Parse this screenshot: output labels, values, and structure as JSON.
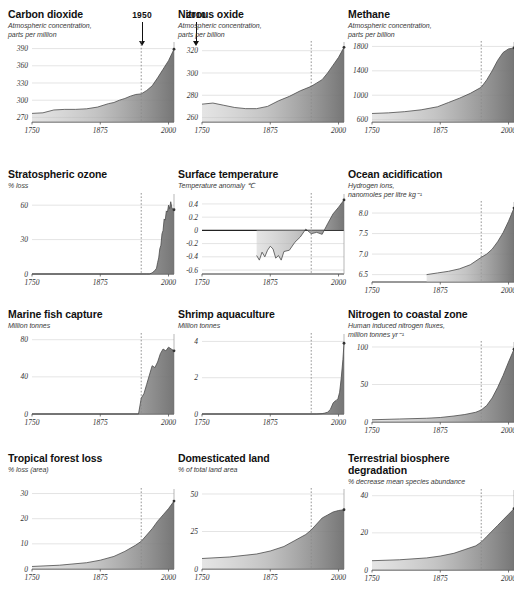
{
  "figure": {
    "annotations": [
      {
        "label": "1950",
        "x": 142
      },
      {
        "label": "2010",
        "x": 196
      }
    ]
  },
  "chart_data": [
    {
      "id": "carbon-dioxide",
      "type": "area",
      "title": "Carbon dioxide",
      "subtitle": "Atmospheric concentration,\nparts per million",
      "ylabel": "Atmospheric concentration, parts per million",
      "xlabel": "",
      "yticks": [
        270,
        300,
        330,
        360,
        390
      ],
      "ylim": [
        262,
        398
      ],
      "xticks": [
        1750,
        1875,
        2000
      ],
      "xlim": [
        1750,
        2010
      ],
      "marker_year": 1950,
      "grid": true,
      "x": [
        1750,
        1770,
        1790,
        1810,
        1830,
        1850,
        1870,
        1890,
        1900,
        1910,
        1920,
        1930,
        1940,
        1950,
        1960,
        1970,
        1980,
        1990,
        2000,
        2010
      ],
      "values": [
        277,
        278,
        283,
        284,
        284,
        285,
        288,
        294,
        296,
        300,
        303,
        307,
        310,
        311,
        317,
        325,
        339,
        354,
        369,
        389
      ]
    },
    {
      "id": "nitrous-oxide",
      "type": "area",
      "title": "Nitrous oxide",
      "subtitle": "Atmospheric concentration,\nparts per billion",
      "ylabel": "Atmospheric concentration, parts per billion",
      "xlabel": "",
      "yticks": [
        260,
        280,
        300,
        320
      ],
      "ylim": [
        256,
        326
      ],
      "xticks": [
        1750,
        1875,
        2000
      ],
      "xlim": [
        1750,
        2010
      ],
      "marker_year": 1950,
      "grid": true,
      "x": [
        1750,
        1770,
        1790,
        1810,
        1830,
        1850,
        1870,
        1890,
        1910,
        1930,
        1950,
        1960,
        1970,
        1980,
        1990,
        2000,
        2010
      ],
      "values": [
        272,
        273,
        271,
        269,
        268,
        268,
        270,
        275,
        279,
        284,
        288,
        291,
        294,
        300,
        307,
        314,
        323
      ]
    },
    {
      "id": "methane",
      "type": "area",
      "title": "Methane",
      "subtitle": "Atmospheric concentration,\nparts per billion",
      "ylabel": "Atmospheric concentration, parts per billion",
      "xlabel": "",
      "yticks": [
        600,
        1000,
        1400,
        1800
      ],
      "ylim": [
        560,
        1840
      ],
      "xticks": [
        1750,
        1875,
        2000
      ],
      "xlim": [
        1750,
        2010
      ],
      "marker_year": 1950,
      "grid": true,
      "x": [
        1750,
        1780,
        1810,
        1840,
        1870,
        1890,
        1910,
        1930,
        1950,
        1960,
        1970,
        1980,
        1990,
        2000,
        2010
      ],
      "values": [
        700,
        710,
        730,
        760,
        810,
        880,
        950,
        1030,
        1130,
        1250,
        1400,
        1570,
        1700,
        1760,
        1775
      ]
    },
    {
      "id": "stratospheric-ozone",
      "type": "area",
      "title": "Stratospheric ozone",
      "subtitle": "% loss",
      "ylabel": "% loss",
      "xlabel": "",
      "yticks": [
        0,
        30,
        60
      ],
      "ylim": [
        0,
        68
      ],
      "xticks": [
        1750,
        1875,
        2000
      ],
      "xlim": [
        1750,
        2010
      ],
      "marker_year": 1950,
      "grid": true,
      "x": [
        1750,
        1960,
        1965,
        1970,
        1975,
        1978,
        1980,
        1982,
        1984,
        1986,
        1988,
        1990,
        1992,
        1994,
        1996,
        1998,
        2000,
        2002,
        2004,
        2006,
        2008,
        2010
      ],
      "values": [
        0,
        0,
        0,
        1,
        3,
        5,
        10,
        14,
        22,
        25,
        35,
        38,
        48,
        47,
        55,
        54,
        60,
        57,
        63,
        58,
        56,
        56
      ]
    },
    {
      "id": "surface-temperature",
      "type": "area",
      "title": "Surface temperature",
      "subtitle": "Temperature anomaly ℃",
      "ylabel": "Temperature anomaly ℃",
      "xlabel": "",
      "yticks": [
        -0.6,
        -0.4,
        -0.2,
        0,
        0.2,
        0.4
      ],
      "ylim": [
        -0.66,
        0.52
      ],
      "xticks": [
        1750,
        1875,
        2000
      ],
      "xlim": [
        1750,
        2010
      ],
      "marker_year": 1950,
      "baseline": 0,
      "grid": true,
      "x": [
        1850,
        1855,
        1860,
        1865,
        1870,
        1875,
        1880,
        1885,
        1890,
        1895,
        1900,
        1910,
        1920,
        1930,
        1940,
        1950,
        1960,
        1970,
        1980,
        1990,
        2000,
        2010
      ],
      "values": [
        -0.38,
        -0.45,
        -0.33,
        -0.4,
        -0.3,
        -0.24,
        -0.28,
        -0.42,
        -0.38,
        -0.45,
        -0.32,
        -0.3,
        -0.18,
        -0.1,
        0.02,
        -0.05,
        -0.03,
        -0.06,
        0.1,
        0.25,
        0.35,
        0.46
      ]
    },
    {
      "id": "ocean-acidification",
      "type": "area",
      "title": "Ocean acidification",
      "subtitle": "Hydrogen ions,\nnanomoles per litre kg⁻¹",
      "ylabel": "Hydrogen ions, nanomoles per litre kg-1",
      "xlabel": "",
      "yticks": [
        6.5,
        7.0,
        7.5,
        8.0
      ],
      "ylim": [
        6.32,
        8.22
      ],
      "xticks": [
        1750,
        1875,
        2000
      ],
      "xlim": [
        1750,
        2010
      ],
      "marker_year": 1950,
      "grid": true,
      "x": [
        1850,
        1870,
        1890,
        1910,
        1930,
        1950,
        1960,
        1970,
        1980,
        1990,
        2000,
        2010
      ],
      "values": [
        6.5,
        6.54,
        6.58,
        6.64,
        6.74,
        6.92,
        7.0,
        7.12,
        7.3,
        7.52,
        7.8,
        8.12
      ]
    },
    {
      "id": "marine-fish-capture",
      "type": "area",
      "title": "Marine fish capture",
      "subtitle": "Million tonnes",
      "ylabel": "Million tonnes",
      "xlabel": "",
      "yticks": [
        0,
        40,
        80
      ],
      "ylim": [
        0,
        84
      ],
      "xticks": [
        1750,
        1875,
        2000
      ],
      "xlim": [
        1750,
        2010
      ],
      "marker_year": 1950,
      "grid": true,
      "x": [
        1750,
        1945,
        1950,
        1955,
        1960,
        1965,
        1970,
        1975,
        1980,
        1985,
        1990,
        1995,
        2000,
        2005,
        2010
      ],
      "values": [
        0,
        0,
        17,
        22,
        32,
        42,
        52,
        50,
        56,
        65,
        70,
        68,
        72,
        70,
        68
      ]
    },
    {
      "id": "shrimp-aquaculture",
      "type": "area",
      "title": "Shrimp aquaculture",
      "subtitle": "Million tonnes",
      "ylabel": "Million tonnes",
      "xlabel": "",
      "yticks": [
        0,
        2,
        4
      ],
      "ylim": [
        0,
        4.3
      ],
      "xticks": [
        1750,
        1875,
        2000
      ],
      "xlim": [
        1750,
        2010
      ],
      "marker_year": 1950,
      "grid": true,
      "x": [
        1750,
        1960,
        1970,
        1975,
        1980,
        1985,
        1990,
        1993,
        1996,
        1999,
        2002,
        2005,
        2008,
        2010
      ],
      "values": [
        0,
        0,
        0.02,
        0.05,
        0.1,
        0.25,
        0.6,
        0.7,
        0.75,
        0.85,
        1.2,
        2.0,
        3.0,
        3.9
      ]
    },
    {
      "id": "nitrogen-to-coastal-zone",
      "type": "area",
      "title": "Nitrogen to coastal zone",
      "subtitle": "Human induced nitrogen fluxes,\nmillion tonnes yr⁻¹",
      "ylabel": "Human induced nitrogen fluxes, million tonnes yr-1",
      "xlabel": "",
      "yticks": [
        0,
        50,
        100
      ],
      "ylim": [
        0,
        104
      ],
      "xticks": [
        1750,
        1875,
        2000
      ],
      "xlim": [
        1750,
        2010
      ],
      "marker_year": 1950,
      "grid": true,
      "x": [
        1750,
        1800,
        1850,
        1875,
        1900,
        1920,
        1940,
        1950,
        1960,
        1970,
        1980,
        1990,
        2000,
        2010
      ],
      "values": [
        3,
        4,
        5,
        6,
        8,
        10,
        13,
        16,
        22,
        32,
        46,
        62,
        80,
        97
      ]
    },
    {
      "id": "tropical-forest-loss",
      "type": "area",
      "title": "Tropical forest loss",
      "subtitle": "% loss (area)",
      "ylabel": "% loss (area)",
      "xlabel": "",
      "yticks": [
        0,
        10,
        20,
        30
      ],
      "ylim": [
        0,
        31
      ],
      "xticks": [
        1750,
        1875,
        2000
      ],
      "xlim": [
        1750,
        2010
      ],
      "marker_year": 1950,
      "grid": true,
      "x": [
        1750,
        1800,
        1850,
        1875,
        1900,
        1920,
        1940,
        1950,
        1960,
        1970,
        1980,
        1990,
        2000,
        2010
      ],
      "values": [
        1,
        1.5,
        2.5,
        3.5,
        5,
        7,
        9.5,
        11,
        13.5,
        16,
        19,
        21.5,
        24,
        27
      ]
    },
    {
      "id": "domesticated-land",
      "type": "area",
      "title": "Domesticated land",
      "subtitle": "% of total land area",
      "ylabel": "% of total land area",
      "xlabel": "",
      "yticks": [
        0,
        25,
        50
      ],
      "ylim": [
        0,
        52
      ],
      "xticks": [
        1750,
        1875,
        2000
      ],
      "xlim": [
        1750,
        2010
      ],
      "marker_year": 1950,
      "grid": true,
      "x": [
        1750,
        1800,
        1850,
        1875,
        1900,
        1920,
        1940,
        1950,
        1960,
        1970,
        1980,
        1990,
        2000,
        2010
      ],
      "values": [
        7,
        8,
        10,
        12,
        15,
        19,
        23,
        26,
        30,
        34,
        36,
        38,
        39,
        39.5
      ]
    },
    {
      "id": "terrestrial-biosphere-degradation",
      "type": "area",
      "title": "Terrestrial biosphere\ndegradation",
      "subtitle": "% decrease mean species abundance",
      "ylabel": "% decrease mean species abundance",
      "xlabel": "",
      "yticks": [
        0,
        20,
        40
      ],
      "ylim": [
        0,
        42
      ],
      "xticks": [
        1750,
        1875,
        2000
      ],
      "xlim": [
        1750,
        2010
      ],
      "marker_year": 1950,
      "grid": true,
      "x": [
        1750,
        1800,
        1850,
        1875,
        1900,
        1920,
        1940,
        1950,
        1960,
        1970,
        1980,
        1990,
        2000,
        2010
      ],
      "values": [
        5,
        5.5,
        6.5,
        7.5,
        9,
        11,
        13,
        15,
        18,
        21,
        24,
        27,
        30,
        33
      ]
    }
  ]
}
